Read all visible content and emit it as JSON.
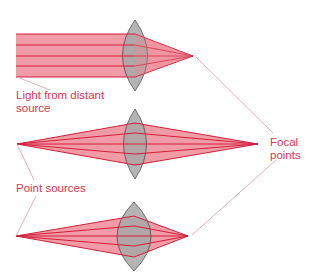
{
  "colors": {
    "beam_fill": "#ef8a97",
    "ray_stroke": "#d21f3c",
    "lens_fill": "#a8a8a8",
    "lens_stroke": "#3a3a3a",
    "label_text": "#d8374f",
    "leader_line": "#e09aa6"
  },
  "labels": {
    "distant_source": "Light from distant\nsource",
    "point_sources": "Point sources",
    "focal_points": "Focal\npoints"
  },
  "diagrams": [
    {
      "id": "distant-source",
      "source": "parallel",
      "lens_cx": 135,
      "focal_point": [
        193,
        56
      ]
    },
    {
      "id": "point-source-near",
      "source": [
        17,
        144
      ],
      "lens_cx": 135,
      "focal_point": [
        258,
        144
      ]
    },
    {
      "id": "point-source-close",
      "source": [
        16,
        236
      ],
      "lens_cx": 134,
      "focal_point": [
        188,
        236
      ]
    }
  ]
}
